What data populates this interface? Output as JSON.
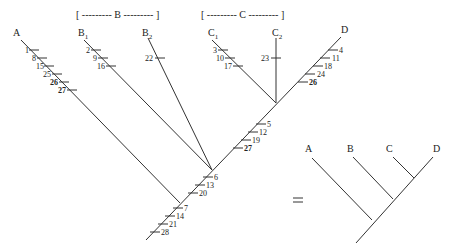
{
  "left_tree": {
    "groups": {
      "B": {
        "label": "[ --------- B --------- ]"
      },
      "C": {
        "label": "[ --------- C --------- ]"
      }
    },
    "taxa": {
      "A": {
        "label": "A"
      },
      "B1": {
        "label": "B",
        "sub": "1"
      },
      "B2": {
        "label": "B",
        "sub": "2"
      },
      "C1": {
        "label": "C",
        "sub": "1"
      },
      "C2": {
        "label": "C",
        "sub": "2"
      },
      "D": {
        "label": "D"
      }
    },
    "characters": {
      "A": [
        "1",
        "8",
        "15",
        "25",
        "26",
        "27"
      ],
      "B1": [
        "2",
        "9",
        "16"
      ],
      "B2": [
        "22"
      ],
      "C1": [
        "3",
        "10",
        "17"
      ],
      "C2": [
        "23"
      ],
      "D": [
        "4",
        "11",
        "18",
        "24",
        "26"
      ],
      "CD_internode": [
        "5",
        "12",
        "19",
        "27"
      ],
      "BCD_internode": [
        "6",
        "13",
        "20"
      ],
      "root": [
        "7",
        "14",
        "21",
        "28"
      ]
    },
    "bold_characters": [
      "26",
      "27"
    ]
  },
  "equals": "=",
  "right_tree": {
    "taxa": [
      "A",
      "B",
      "C",
      "D"
    ]
  }
}
